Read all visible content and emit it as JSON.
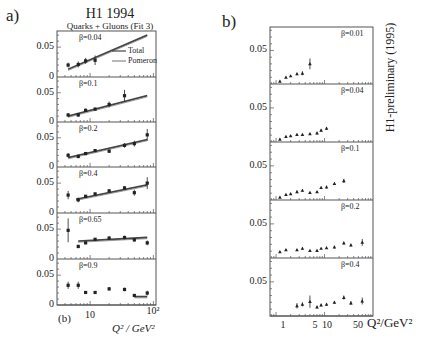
{
  "labels": {
    "panel_a": "a)",
    "panel_b": "b)",
    "title_a": "H1 1994",
    "subtitle_a": "Quarks + Gluons (Fit 3)",
    "legend_total": "Total",
    "legend_pomeron": "Pomeron",
    "corner_b": "(b)",
    "xaxis_a": "Q² / GeV²",
    "xaxis_b": "Q²/GeV²",
    "side_text_b": "H1-preliminary (1995)",
    "y_tick_005": "0.05",
    "y_tick_0": "0",
    "x_ticks_a": [
      "10",
      "10²"
    ],
    "x_ticks_b": [
      "1",
      "5",
      "10",
      "50"
    ]
  },
  "colors": {
    "ink": "#222222",
    "frame": "#555555",
    "fit_line": "#444444"
  },
  "chart_data": [
    {
      "type": "scatter",
      "title": "H1 1994 — Quarks + Gluons (Fit 3)",
      "xlabel": "Q² / GeV²",
      "ylabel": "",
      "xscale": "log",
      "xlim": [
        3,
        110
      ],
      "ylim": [
        0,
        0.077
      ],
      "legend": [
        "Total",
        "Pomeron"
      ],
      "panels": [
        {
          "beta": "β=0.04",
          "x": [
            4.5,
            6.5,
            8.5,
            12
          ],
          "y": [
            0.02,
            0.021,
            0.027,
            0.028
          ],
          "err": [
            0.004,
            0.005,
            0.005,
            0.008
          ],
          "fit": {
            "x": [
              4.5,
              80
            ],
            "y": [
              0.013,
              0.07
            ]
          }
        },
        {
          "beta": "β=0.1",
          "x": [
            4.5,
            6.5,
            8.5,
            12,
            20,
            35
          ],
          "y": [
            0.012,
            0.012,
            0.02,
            0.022,
            0.03,
            0.045
          ],
          "err": [
            0.003,
            0.003,
            0.003,
            0.003,
            0.005,
            0.01
          ],
          "fit": {
            "x": [
              4.5,
              80
            ],
            "y": [
              0.01,
              0.045
            ]
          }
        },
        {
          "beta": "β=0.2",
          "x": [
            4.5,
            6.5,
            8.5,
            12,
            20,
            35,
            50,
            80
          ],
          "y": [
            0.02,
            0.018,
            0.023,
            0.028,
            0.027,
            0.037,
            0.04,
            0.055
          ],
          "err": [
            0.004,
            0.003,
            0.002,
            0.002,
            0.003,
            0.004,
            0.005,
            0.01
          ],
          "fit": {
            "x": [
              4.5,
              80
            ],
            "y": [
              0.016,
              0.047
            ]
          }
        },
        {
          "beta": "β=0.4",
          "x": [
            4.5,
            6.5,
            8.5,
            12,
            20,
            35,
            50,
            80
          ],
          "y": [
            0.03,
            0.022,
            0.028,
            0.032,
            0.037,
            0.042,
            0.034,
            0.05
          ],
          "err": [
            0.007,
            0.004,
            0.002,
            0.002,
            0.003,
            0.003,
            0.005,
            0.01
          ],
          "fit": {
            "x": [
              6,
              80
            ],
            "y": [
              0.023,
              0.047
            ]
          }
        },
        {
          "beta": "β=0.65",
          "x": [
            4.5,
            6.5,
            8.5,
            12,
            20,
            35,
            50,
            80
          ],
          "y": [
            0.048,
            0.021,
            0.027,
            0.033,
            0.035,
            0.036,
            0.032,
            0.027
          ],
          "err": [
            0.02,
            0.003,
            0.002,
            0.002,
            0.003,
            0.003,
            0.003,
            0.004
          ],
          "fit": {
            "x": [
              6.5,
              80
            ],
            "y": [
              0.03,
              0.036
            ]
          }
        },
        {
          "beta": "β=0.9",
          "x": [
            4.5,
            6.5,
            8.5,
            12,
            20,
            35,
            50,
            80
          ],
          "y": [
            0.033,
            0.033,
            0.021,
            0.021,
            0.027,
            0.026,
            0.016,
            0.02
          ],
          "err": [
            0.006,
            0.006,
            0.002,
            0.002,
            0.003,
            0.003,
            0.002,
            0.004
          ],
          "fit": {
            "x": [
              50,
              80
            ],
            "y": [
              0.014,
              0.014
            ]
          }
        }
      ]
    },
    {
      "type": "scatter",
      "title": "H1-preliminary (1995)",
      "xlabel": "Q²/GeV²",
      "ylabel": "",
      "xscale": "log",
      "xlim": [
        0.75,
        100
      ],
      "ylim": [
        0,
        0.085
      ],
      "panels": [
        {
          "beta": "β=0.01",
          "x": [
            1.2,
            1.6,
            2,
            2.7,
            3.5,
            5
          ],
          "y": [
            0.004,
            0.01,
            0.012,
            0.015,
            0.016,
            0.03
          ],
          "err": [
            0.001,
            0.001,
            0.001,
            0.002,
            0.003,
            0.008
          ]
        },
        {
          "beta": "β=0.04",
          "x": [
            1.2,
            1.6,
            2,
            2.7,
            3.5,
            5,
            7,
            8.5,
            11
          ],
          "y": [
            0.004,
            0.008,
            0.009,
            0.011,
            0.011,
            0.012,
            0.013,
            0.017,
            0.02
          ],
          "err": [
            0.001,
            0.001,
            0.001,
            0.001,
            0.001,
            0.001,
            0.002,
            0.002,
            0.002
          ]
        },
        {
          "beta": "β=0.1",
          "x": [
            1.2,
            1.6,
            2,
            2.7,
            3.5,
            5,
            7,
            8.5,
            11,
            16,
            25
          ],
          "y": [
            0.004,
            0.008,
            0.009,
            0.012,
            0.014,
            0.011,
            0.012,
            0.018,
            0.019,
            0.024,
            0.028
          ],
          "err": [
            0.001,
            0.001,
            0.001,
            0.002,
            0.002,
            0.001,
            0.001,
            0.002,
            0.002,
            0.002,
            0.003
          ]
        },
        {
          "beta": "β=0.2",
          "x": [
            1.2,
            1.6,
            2.7,
            3.5,
            5,
            7,
            8.5,
            11,
            16,
            25,
            35,
            60
          ],
          "y": [
            0.009,
            0.012,
            0.012,
            0.014,
            0.011,
            0.011,
            0.014,
            0.015,
            0.016,
            0.022,
            0.019,
            0.023
          ],
          "err": [
            0.001,
            0.001,
            0.001,
            0.002,
            0.001,
            0.001,
            0.001,
            0.001,
            0.002,
            0.002,
            0.002,
            0.005
          ]
        },
        {
          "beta": "β=0.4",
          "x": [
            2.7,
            3.5,
            5,
            7,
            8.5,
            11,
            16,
            25,
            35,
            60
          ],
          "y": [
            0.015,
            0.017,
            0.021,
            0.013,
            0.016,
            0.017,
            0.02,
            0.027,
            0.019,
            0.022
          ],
          "err": [
            0.004,
            0.003,
            0.009,
            0.002,
            0.002,
            0.002,
            0.002,
            0.003,
            0.003,
            0.005
          ]
        }
      ]
    }
  ]
}
